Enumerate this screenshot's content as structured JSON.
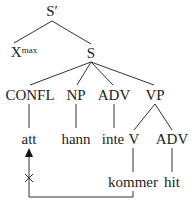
{
  "tree": {
    "root": {
      "label": "S′"
    },
    "level1": [
      {
        "label": "X",
        "superscript": "max"
      },
      {
        "label": "S"
      }
    ],
    "level2": [
      {
        "label": "CONFL"
      },
      {
        "label": "NP"
      },
      {
        "label": "ADV"
      },
      {
        "label": "VP"
      }
    ],
    "level3": [
      {
        "label": "att"
      },
      {
        "label": "hann"
      },
      {
        "label": "inte"
      },
      {
        "label": "V"
      },
      {
        "label": "ADV"
      }
    ],
    "level4": [
      {
        "label": "kommer"
      },
      {
        "label": "hit"
      }
    ]
  },
  "movement": {
    "from": "kommer",
    "to": "att",
    "blocked": true,
    "blocked_marker": "×"
  },
  "colors": {
    "line": "#333333",
    "text": "#222222"
  }
}
